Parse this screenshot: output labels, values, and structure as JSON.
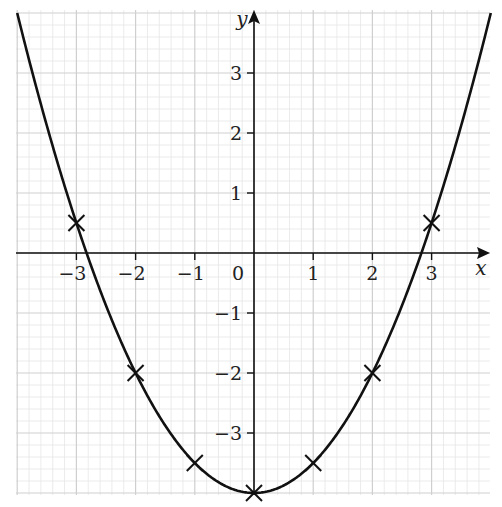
{
  "chart_data": {
    "type": "line",
    "title": "",
    "xlabel": "x",
    "ylabel": "y",
    "xlim": [
      -4,
      4
    ],
    "ylim": [
      -4,
      4
    ],
    "grid": true,
    "x_ticks": [
      -3,
      -2,
      -1,
      0,
      1,
      2,
      3
    ],
    "y_ticks": [
      -3,
      -2,
      -1,
      1,
      2,
      3
    ],
    "x_tick_labels": [
      "−3",
      "−2",
      "−1",
      "0",
      "1",
      "2",
      "3"
    ],
    "y_tick_labels": [
      "−3",
      "−2",
      "−1",
      "1",
      "2",
      "3"
    ],
    "origin_label": "0",
    "curve": {
      "equation": "y = 0.5x^2 - 4",
      "a": 0.5,
      "b": 0,
      "c": -4,
      "x_range": [
        -4,
        4
      ],
      "color": "#111111"
    },
    "series": [
      {
        "name": "plotted points",
        "marker": "x",
        "x": [
          -3,
          -2,
          -1,
          0,
          1,
          2,
          3
        ],
        "y": [
          0.5,
          -2,
          -3.5,
          -4,
          -3.5,
          -2,
          0.5
        ]
      }
    ]
  },
  "axes": {
    "x_label": "x",
    "y_label": "y",
    "origin_label": "0"
  }
}
